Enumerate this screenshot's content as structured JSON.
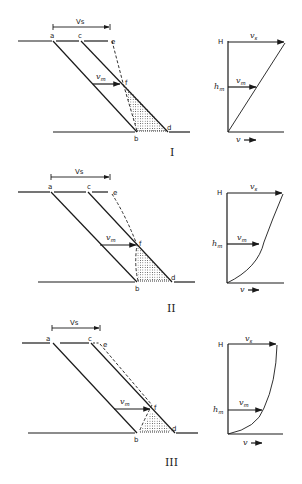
{
  "figure": {
    "panels": [
      {
        "id": "I",
        "roman": "I",
        "slope_labels": {
          "a": "a",
          "b": "b",
          "c": "c",
          "d": "d",
          "e": "e",
          "f": "f"
        },
        "bracket_label": "Vs",
        "vm_label_main": "v",
        "vm_label_sub": "m",
        "profile": {
          "top_label": "H",
          "mid_label_main": "h",
          "mid_label_sub": "m",
          "vs_main": "v",
          "vs_sub": "s",
          "vm_main": "v",
          "vm_sub": "m",
          "axis_label": "v",
          "shape": "linear"
        }
      },
      {
        "id": "II",
        "roman": "II",
        "slope_labels": {
          "a": "a",
          "b": "b",
          "c": "c",
          "d": "d",
          "e": "e",
          "f": "f"
        },
        "bracket_label": "Vs",
        "vm_label_main": "v",
        "vm_label_sub": "m",
        "profile": {
          "top_label": "H",
          "mid_label_main": "h",
          "mid_label_sub": "m",
          "vs_main": "v",
          "vs_sub": "s",
          "vm_main": "v",
          "vm_sub": "m",
          "axis_label": "v",
          "shape": "convex curve"
        }
      },
      {
        "id": "III",
        "roman": "III",
        "slope_labels": {
          "a": "a",
          "b": "b",
          "c": "c",
          "d": "d",
          "e": "e",
          "f": "f"
        },
        "bracket_label": "Vs",
        "vm_label_main": "v",
        "vm_label_sub": "m",
        "profile": {
          "top_label": "H",
          "mid_label_main": "h",
          "mid_label_sub": "m",
          "vs_main": "v",
          "vs_sub": "s",
          "vm_main": "v",
          "vm_sub": "m",
          "axis_label": "v",
          "shape": "strongly convex curve"
        }
      }
    ],
    "colors": {
      "ink": "#1a1a1a",
      "background": "#ffffff"
    }
  }
}
